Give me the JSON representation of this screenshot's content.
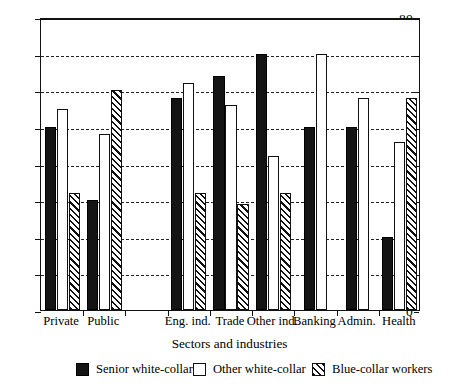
{
  "chart_data": {
    "type": "bar",
    "title": "",
    "xlabel": "Sectors and industries",
    "ylabel": "",
    "ylim": [
      0,
      80
    ],
    "ytick_step": 10,
    "yticks": [
      0,
      10,
      20,
      30,
      40,
      50,
      60,
      70,
      80
    ],
    "grid": "horizontal-dashed",
    "legend_position": "bottom",
    "categories": [
      "Private",
      "Public",
      "",
      "Eng. ind.",
      "Trade",
      "Other ind.",
      "Banking",
      "Admin.",
      "Health"
    ],
    "series": [
      {
        "name": "Senior white-collar",
        "style": "solid-black",
        "color": "#141414",
        "values": [
          50,
          30,
          null,
          58,
          64,
          70,
          50,
          50,
          20
        ]
      },
      {
        "name": "Other white-collar",
        "style": "open-white",
        "color": "#ffffff",
        "values": [
          55,
          48,
          null,
          62,
          56,
          42,
          70,
          58,
          46
        ]
      },
      {
        "name": "Blue-collar workers",
        "style": "diagonal-hatch",
        "color": "#ffffff",
        "values": [
          32,
          60,
          null,
          32,
          29,
          32,
          null,
          null,
          58
        ]
      }
    ]
  },
  "axis": {
    "x_title": "Sectors and industries",
    "y_tick_labels": [
      "0",
      "10",
      "20",
      "30",
      "40",
      "50",
      "60",
      "70",
      "80"
    ]
  },
  "legend": {
    "items": [
      {
        "label": "Senior white-collar",
        "swatch": "solid-black-swatch"
      },
      {
        "label": "Other white-collar",
        "swatch": "open-white-swatch"
      },
      {
        "label": "Blue-collar workers",
        "swatch": "diagonal-hatch-swatch"
      }
    ]
  }
}
